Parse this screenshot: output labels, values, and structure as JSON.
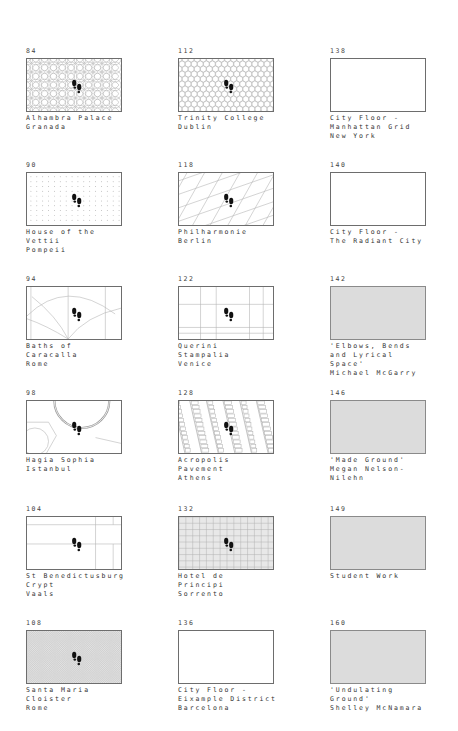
{
  "page": {
    "columns": [
      {
        "tiles": [
          {
            "page": "84",
            "lines": [
              "Alhambra Palace",
              "Granada"
            ],
            "pattern": "islamic-star",
            "footprints": true,
            "fill": "white"
          },
          {
            "page": "90",
            "lines": [
              "House of the",
              "Vettii",
              "Pompeii"
            ],
            "pattern": "dot-grid",
            "footprints": true,
            "fill": "white"
          },
          {
            "page": "94",
            "lines": [
              "Baths of",
              "Caracalla",
              "Rome"
            ],
            "pattern": "arcs",
            "footprints": true,
            "fill": "white"
          },
          {
            "page": "98",
            "lines": [
              "Hagia Sophia",
              "Istanbul"
            ],
            "pattern": "dome-plan",
            "footprints": true,
            "fill": "white"
          },
          {
            "page": "104",
            "lines": [
              "St Benedictusburg",
              "Crypt",
              "Vaals"
            ],
            "pattern": "crypt-lines",
            "footprints": true,
            "fill": "white"
          },
          {
            "page": "108",
            "lines": [
              "Santa Maria",
              "Cloister",
              "Rome"
            ],
            "pattern": "fine-crosshatch",
            "footprints": true,
            "fill": "white"
          }
        ]
      },
      {
        "tiles": [
          {
            "page": "112",
            "lines": [
              "Trinity College",
              "Dublin"
            ],
            "pattern": "hexagons",
            "footprints": true,
            "fill": "white"
          },
          {
            "page": "118",
            "lines": [
              "Philharmonie",
              "Berlin"
            ],
            "pattern": "skewed-grid",
            "footprints": true,
            "fill": "white"
          },
          {
            "page": "122",
            "lines": [
              "Querini",
              "Stampalia",
              "Venice"
            ],
            "pattern": "rect-grid",
            "footprints": true,
            "fill": "white"
          },
          {
            "page": "128",
            "lines": [
              "Acropolis",
              "Pavement",
              "Athens"
            ],
            "pattern": "stone-pavement",
            "footprints": true,
            "fill": "white"
          },
          {
            "page": "132",
            "lines": [
              "Hotel de",
              "Principi",
              "Sorrento"
            ],
            "pattern": "tile-grid",
            "footprints": true,
            "fill": "white"
          },
          {
            "page": "136",
            "lines": [
              "City Floor -",
              "Eixample District",
              "Barcelona"
            ],
            "pattern": "none",
            "footprints": false,
            "fill": "white"
          }
        ]
      },
      {
        "tiles": [
          {
            "page": "138",
            "lines": [
              "City Floor -",
              "Manhattan Grid",
              "New York"
            ],
            "pattern": "none",
            "footprints": false,
            "fill": "white"
          },
          {
            "page": "140",
            "lines": [
              "City Floor -",
              "The Radiant City"
            ],
            "pattern": "none",
            "footprints": false,
            "fill": "white"
          },
          {
            "page": "142",
            "lines": [
              "'Elbows, Bends",
              "and Lyrical",
              "Space'",
              "Michael McGarry"
            ],
            "pattern": "none",
            "footprints": false,
            "fill": "gray"
          },
          {
            "page": "146",
            "lines": [
              "'Made Ground'",
              "Megan Nelson-",
              "Nilehn"
            ],
            "pattern": "none",
            "footprints": false,
            "fill": "gray"
          },
          {
            "page": "149",
            "lines": [
              "Student Work"
            ],
            "pattern": "none",
            "footprints": false,
            "fill": "gray"
          },
          {
            "page": "160",
            "lines": [
              "'Undulating",
              "Ground'",
              "Shelley McNamara"
            ],
            "pattern": "none",
            "footprints": false,
            "fill": "gray"
          }
        ]
      }
    ]
  },
  "icons": {
    "footprints": "footprints-icon"
  },
  "colors": {
    "frame": "#6d6d6d",
    "gray_fill": "#dcdcdc",
    "pattern_line": "#b5b5b5",
    "footprint": "#111111"
  }
}
